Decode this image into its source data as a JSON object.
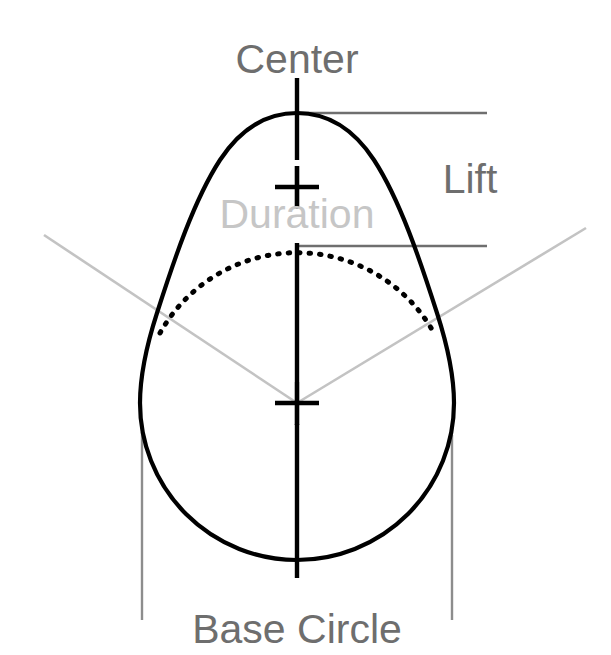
{
  "diagram": {
    "background_color": "#ffffff",
    "labels": {
      "center": "Center",
      "lift": "Lift",
      "duration": "Duration",
      "base_circle": "Base Circle"
    },
    "colors": {
      "profile_stroke": "#000000",
      "label_gray": "#6e6e6e",
      "label_light_gray": "#c6c6c6",
      "dimension_line": "#6f6f6f",
      "extension_line": "#8d8d8d",
      "duration_ray": "#c3c3c3"
    },
    "geometry": {
      "base_circle_center_x": 297,
      "base_circle_center_y": 403,
      "base_circle_radius": 157,
      "nose_tip_x": 297,
      "nose_tip_y": 113,
      "lift_top_y": 113,
      "lift_bottom_y": 246,
      "base_circle_left_x": 142,
      "base_circle_right_x": 452
    },
    "elements": [
      "lobe-profile-outline",
      "base-circle-hidden-arc",
      "vertical-centerline",
      "center-cross-mark",
      "nose-cross-mark",
      "lift-dimension-lines",
      "duration-angle-rays",
      "base-circle-extension-lines"
    ]
  }
}
